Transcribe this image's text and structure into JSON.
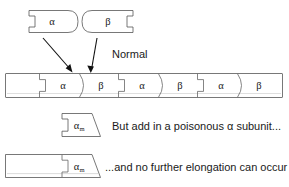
{
  "figure": {
    "background_color": "#ffffff",
    "outline_color": "#555555",
    "text_color": "#1a1a1a",
    "gradient": {
      "highlight": "#fdfdfd",
      "light": "#efefef",
      "mid": "#d8d8d8",
      "dark": "#bdbdbd",
      "shadow": "#a8a8a8"
    }
  },
  "free_subunits": {
    "alpha": {
      "label": "α",
      "name": "alpha-subunit"
    },
    "beta": {
      "label": "β",
      "name": "beta-subunit"
    }
  },
  "annotations": {
    "normal": "Normal",
    "poison": "But add in a poisonous α subunit...",
    "blocked": "...and no further elongation can occur"
  },
  "filament": {
    "name": "normal-filament",
    "segments": [
      {
        "label": "α",
        "type": "alpha"
      },
      {
        "label": "β",
        "type": "beta"
      },
      {
        "label": "α",
        "type": "alpha"
      },
      {
        "label": "β",
        "type": "beta"
      },
      {
        "label": "α",
        "type": "alpha"
      },
      {
        "label": "β",
        "type": "beta"
      }
    ]
  },
  "poison_subunit": {
    "label": "α",
    "subscript": "m",
    "name": "poisonous-alpha-m-subunit"
  },
  "blocked_filament": {
    "name": "blocked-filament",
    "cap": {
      "label": "α",
      "subscript": "m"
    }
  },
  "arrows": [
    {
      "name": "arrow-alpha-to-filament"
    },
    {
      "name": "arrow-beta-to-filament"
    }
  ]
}
